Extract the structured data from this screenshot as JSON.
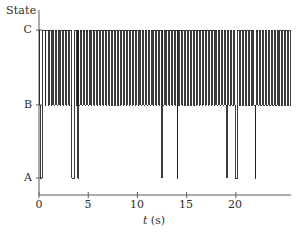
{
  "figure": {
    "background": "#ffffff",
    "line_color": "#1a1a1a",
    "axis_color": "#555555",
    "width": 308,
    "height": 240
  },
  "axes": {
    "ylabel": "State",
    "xlabel_italic": "t",
    "xlabel_units": "(s)",
    "y_ticks": [
      {
        "label": "A",
        "value": 0
      },
      {
        "label": "B",
        "value": 1
      },
      {
        "label": "C",
        "value": 2
      }
    ],
    "x_ticks": [
      {
        "label": "0",
        "value": 0
      },
      {
        "label": "5",
        "value": 5
      },
      {
        "label": "10",
        "value": 10
      },
      {
        "label": "15",
        "value": 15
      },
      {
        "label": "20",
        "value": 20
      }
    ],
    "xlim": [
      -0.35,
      25.6
    ],
    "ylim": [
      -0.12,
      2.1
    ],
    "x_axis_start": 0,
    "x_axis_end": 25.6
  },
  "chart_data": {
    "type": "line",
    "title": "",
    "xlabel": "t (s)",
    "ylabel": "State",
    "x_tick_labels": [
      "0",
      "5",
      "10",
      "15",
      "20"
    ],
    "x_tick_values": [
      0,
      5,
      10,
      15,
      20
    ],
    "y_tick_labels": [
      "A",
      "B",
      "C"
    ],
    "y_tick_values": [
      0,
      1,
      2
    ],
    "xlim": [
      -0.35,
      25.6
    ],
    "ylim": [
      -0.12,
      2.1
    ],
    "grid": false,
    "legend": null,
    "state_levels": {
      "A": 0,
      "B": 1,
      "C": 2
    },
    "a_excursions": [
      {
        "t_start": 0.14,
        "t_end": 0.35
      },
      {
        "t_start": 3.35,
        "t_end": 3.62
      },
      {
        "t_start": 3.95,
        "t_end": 4.02
      },
      {
        "t_start": 12.45,
        "t_end": 12.52
      },
      {
        "t_start": 14.05,
        "t_end": 14.12
      },
      {
        "t_start": 19.05,
        "t_end": 19.12
      },
      {
        "t_start": 19.95,
        "t_end": 20.18
      },
      {
        "t_start": 21.95,
        "t_end": 22.02
      }
    ],
    "bc_switch_times": [
      0.1,
      0.33,
      0.62,
      0.7,
      0.96,
      1.05,
      1.25,
      1.36,
      1.52,
      1.65,
      1.82,
      1.94,
      2.12,
      2.22,
      2.4,
      2.5,
      2.7,
      2.82,
      3.0,
      3.12,
      3.3,
      3.64,
      3.78,
      3.92,
      4.05,
      4.2,
      4.36,
      4.48,
      4.66,
      4.78,
      4.96,
      5.08,
      5.24,
      5.38,
      5.56,
      5.68,
      5.86,
      5.98,
      6.16,
      6.28,
      6.46,
      6.58,
      6.76,
      6.88,
      7.06,
      7.18,
      7.36,
      7.48,
      7.66,
      7.78,
      7.96,
      8.08,
      8.26,
      8.38,
      8.56,
      8.68,
      8.86,
      8.98,
      9.16,
      9.28,
      9.46,
      9.58,
      9.76,
      9.88,
      10.06,
      10.18,
      10.36,
      10.48,
      10.66,
      10.78,
      10.96,
      11.08,
      11.26,
      11.38,
      11.56,
      11.68,
      11.86,
      11.98,
      12.16,
      12.28,
      12.55,
      12.7,
      12.88,
      13.0,
      13.18,
      13.3,
      13.48,
      13.6,
      13.78,
      13.9,
      14.15,
      14.3,
      14.48,
      14.6,
      14.78,
      14.9,
      15.08,
      15.2,
      15.38,
      15.5,
      15.68,
      15.8,
      15.98,
      16.1,
      16.28,
      16.4,
      16.58,
      16.7,
      16.88,
      17.0,
      17.18,
      17.3,
      17.48,
      17.6,
      17.78,
      17.9,
      18.08,
      18.2,
      18.38,
      18.5,
      18.68,
      18.8,
      18.98,
      19.15,
      19.3,
      19.48,
      19.6,
      19.78,
      19.9,
      20.2,
      20.35,
      20.52,
      20.64,
      20.82,
      20.94,
      21.12,
      21.24,
      21.42,
      21.54,
      21.72,
      21.84,
      22.05,
      22.2,
      22.38,
      22.5,
      22.68,
      22.8,
      22.98,
      23.1,
      23.28,
      23.4,
      23.58,
      23.7,
      23.88,
      24.0,
      24.18,
      24.3,
      24.48,
      24.6,
      24.78,
      24.9,
      25.08,
      25.2,
      25.38,
      25.5
    ]
  }
}
